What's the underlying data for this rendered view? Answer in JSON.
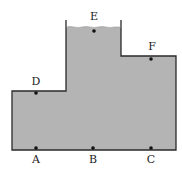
{
  "diagram": {
    "colors": {
      "fill": "#b4b4b4",
      "stroke": "#2a2a2a",
      "dot": "#111111",
      "background": "#ffffff"
    },
    "points": [
      {
        "id": "E",
        "label": "E",
        "dot": [
          94,
          31
        ],
        "label_pos": [
          94,
          20
        ]
      },
      {
        "id": "F",
        "label": "F",
        "dot": [
          151,
          59
        ],
        "label_pos": [
          152,
          49
        ]
      },
      {
        "id": "D",
        "label": "D",
        "dot": [
          36,
          93
        ],
        "label_pos": [
          36,
          84
        ]
      },
      {
        "id": "A",
        "label": "A",
        "dot": [
          36,
          148
        ],
        "label_pos": [
          36,
          162
        ]
      },
      {
        "id": "B",
        "label": "B",
        "dot": [
          93,
          148
        ],
        "label_pos": [
          93,
          162
        ]
      },
      {
        "id": "C",
        "label": "C",
        "dot": [
          151,
          148
        ],
        "label_pos": [
          151,
          162
        ]
      }
    ]
  }
}
